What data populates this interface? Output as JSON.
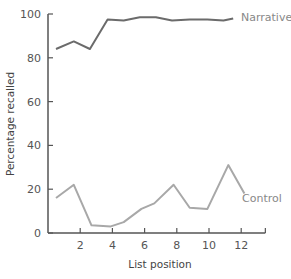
{
  "chart_data": {
    "type": "line",
    "title": "",
    "xlabel": "List position",
    "ylabel": "Percentage recalled",
    "xlim": [
      0,
      13.5
    ],
    "ylim": [
      0,
      100
    ],
    "xticks": [
      2,
      4,
      6,
      8,
      10,
      12
    ],
    "yticks": [
      0,
      20,
      40,
      60,
      80,
      100
    ],
    "grid": false,
    "legend_position": "inline-right",
    "series": [
      {
        "name": "Narrative",
        "color": "#6b6b6b",
        "x": [
          0.5,
          1.6,
          2.6,
          3.7,
          4.7,
          5.7,
          6.7,
          7.7,
          8.8,
          9.9,
          10.9,
          11.5
        ],
        "values": [
          84,
          87.5,
          84,
          97.5,
          97,
          98.5,
          98.5,
          97,
          97.5,
          97.5,
          97,
          98
        ]
      },
      {
        "name": "Control",
        "color": "#a8a8a8",
        "x": [
          0.5,
          1.6,
          2.7,
          3.9,
          4.7,
          5.8,
          6.6,
          7.8,
          8.8,
          9.9,
          11.2,
          12.2
        ],
        "values": [
          16,
          22,
          3.5,
          3,
          5,
          11,
          13.5,
          22,
          11.5,
          11,
          31,
          18
        ]
      }
    ]
  },
  "labels": {
    "xlabel": "List position",
    "ylabel": "Percentage recalled",
    "narrative": "Narrative",
    "control": "Control",
    "yticks": [
      "0",
      "20",
      "40",
      "60",
      "80",
      "100"
    ],
    "xticks": [
      "2",
      "4",
      "6",
      "8",
      "10",
      "12"
    ]
  }
}
